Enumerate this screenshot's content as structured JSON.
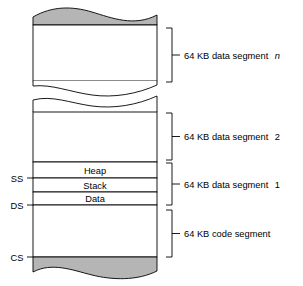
{
  "figure": {
    "type": "memory-segment-diagram",
    "background_color": "#ffffff",
    "line_color": "#000000",
    "fill_color": "#b5b5b5"
  },
  "memory_rows": [
    {
      "id": "heap",
      "label": "Heap"
    },
    {
      "id": "stack",
      "label": "Stack"
    },
    {
      "id": "data",
      "label": "Data"
    }
  ],
  "registers": [
    {
      "id": "ss",
      "label": "SS"
    },
    {
      "id": "ds",
      "label": "DS"
    },
    {
      "id": "cs",
      "label": "CS"
    }
  ],
  "segments": [
    {
      "id": "data-n",
      "label_prefix": "64 KB data segment",
      "label_suffix": "n",
      "suffix_italic": true
    },
    {
      "id": "data-2",
      "label_prefix": "64 KB data segment",
      "label_suffix": "2",
      "suffix_italic": false
    },
    {
      "id": "data-1",
      "label_prefix": "64 KB data segment",
      "label_suffix": "1",
      "suffix_italic": false
    },
    {
      "id": "code",
      "label_prefix": "64 KB code segment",
      "label_suffix": "",
      "suffix_italic": false
    }
  ]
}
